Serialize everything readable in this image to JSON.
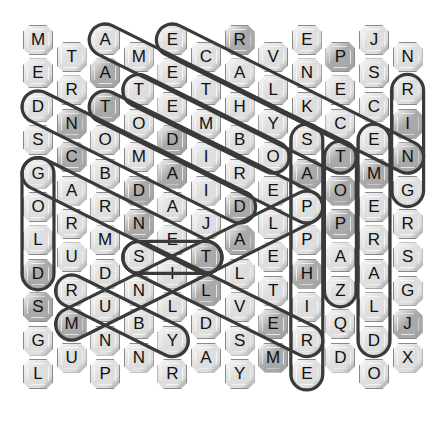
{
  "puzzle": {
    "columns": [
      [
        "M",
        "E",
        "D",
        "S",
        "G",
        "O",
        "L",
        "D",
        "S",
        "G",
        "L"
      ],
      [
        "T",
        "R",
        "N",
        "C",
        "A",
        "R",
        "U",
        "R",
        "M",
        "U"
      ],
      [
        "A",
        "A",
        "T",
        "O",
        "B",
        "R",
        "M",
        "D",
        "U",
        "N",
        "P"
      ],
      [
        "M",
        "T",
        "O",
        "M",
        "D",
        "N",
        "S",
        "N",
        "B",
        "N"
      ],
      [
        "E",
        "E",
        "E",
        "D",
        "A",
        "A",
        "E",
        "I",
        "L",
        "Y",
        "R"
      ],
      [
        "C",
        "T",
        "M",
        "I",
        "I",
        "J",
        "T",
        "L",
        "D",
        "A"
      ],
      [
        "R",
        "A",
        "H",
        "B",
        "R",
        "D",
        "A",
        "L",
        "V",
        "S",
        "Y"
      ],
      [
        "V",
        "L",
        "Y",
        "O",
        "E",
        "L",
        "E",
        "T",
        "E",
        "M"
      ],
      [
        "E",
        "N",
        "K",
        "S",
        "A",
        "P",
        "P",
        "H",
        "I",
        "R",
        "E"
      ],
      [
        "P",
        "E",
        "C",
        "T",
        "O",
        "P",
        "A",
        "Z",
        "Q",
        "D"
      ],
      [
        "J",
        "S",
        "C",
        "E",
        "M",
        "E",
        "R",
        "A",
        "L",
        "D",
        "O"
      ],
      [
        "N",
        "R",
        "I",
        "N",
        "G",
        "R",
        "S",
        "G",
        "J",
        "X"
      ]
    ],
    "dark_tiles": [
      [
        2,
        1
      ],
      [
        6,
        0
      ],
      [
        9,
        0
      ],
      [
        2,
        2
      ],
      [
        1,
        2
      ],
      [
        1,
        3
      ],
      [
        4,
        3
      ],
      [
        3,
        4
      ],
      [
        4,
        4
      ],
      [
        3,
        5
      ],
      [
        6,
        5
      ],
      [
        6,
        6
      ],
      [
        5,
        6
      ],
      [
        5,
        7
      ],
      [
        11,
        2
      ],
      [
        11,
        3
      ],
      [
        9,
        3
      ],
      [
        9,
        4
      ],
      [
        9,
        5
      ],
      [
        1,
        8
      ],
      [
        0,
        8
      ],
      [
        7,
        8
      ],
      [
        7,
        9
      ],
      [
        8,
        7
      ],
      [
        11,
        8
      ],
      [
        0,
        7
      ],
      [
        8,
        4
      ],
      [
        10,
        4
      ]
    ],
    "found_words": [
      {
        "word": "AMETHYST",
        "start": [
          2,
          0
        ],
        "end": [
          9,
          3
        ]
      },
      {
        "word": "NECKLACE",
        "start": [
          4,
          0
        ],
        "end": [
          11,
          3
        ]
      },
      {
        "word": "TEMBO",
        "start": [
          3,
          1
        ],
        "end": [
          7,
          3
        ]
      },
      {
        "word": "PERIDOT",
        "start": [
          2,
          2
        ],
        "end": [
          8,
          5
        ]
      },
      {
        "word": "DIAMOND",
        "start": [
          0,
          2
        ],
        "end": [
          6,
          5
        ]
      },
      {
        "word": "GARNET",
        "start": [
          0,
          4
        ],
        "end": [
          5,
          6
        ]
      },
      {
        "word": "GOLD",
        "start": [
          0,
          4
        ],
        "end": [
          0,
          7
        ]
      },
      {
        "word": "PLATINUM",
        "start": [
          8,
          5
        ],
        "end": [
          1,
          8
        ]
      },
      {
        "word": "RUBY",
        "start": [
          1,
          7
        ],
        "end": [
          4,
          9
        ]
      },
      {
        "word": "SILVER",
        "start": [
          3,
          6
        ],
        "end": [
          8,
          9
        ]
      },
      {
        "word": "SIT",
        "start": [
          3,
          6
        ],
        "end": [
          5,
          6
        ]
      },
      {
        "word": "SAPPHIRE",
        "start": [
          8,
          3
        ],
        "end": [
          8,
          10
        ]
      },
      {
        "word": "TOPAZ",
        "start": [
          9,
          3
        ],
        "end": [
          9,
          7
        ]
      },
      {
        "word": "EMERALD",
        "start": [
          10,
          3
        ],
        "end": [
          10,
          9
        ]
      },
      {
        "word": "RING",
        "start": [
          11,
          1
        ],
        "end": [
          11,
          4
        ]
      }
    ],
    "colors": {
      "tile_light": "#dedede",
      "tile_dark": "#a9a9a9",
      "loop_stroke": "#3a3a3a",
      "background": "#ffffff"
    }
  }
}
